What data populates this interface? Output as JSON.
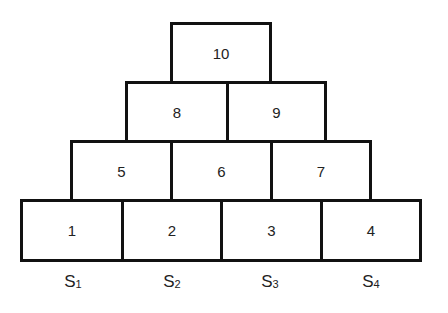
{
  "diagram": {
    "type": "pyramid of boxes",
    "rows": [
      {
        "boxes": [
          "10"
        ]
      },
      {
        "boxes": [
          "8",
          "9"
        ]
      },
      {
        "boxes": [
          "5",
          "6",
          "7"
        ]
      },
      {
        "boxes": [
          "1",
          "2",
          "3",
          "4"
        ]
      }
    ],
    "labels": [
      {
        "main": "S",
        "sub": "1"
      },
      {
        "main": "S",
        "sub": "2"
      },
      {
        "main": "S",
        "sub": "3"
      },
      {
        "main": "S",
        "sub": "4"
      }
    ]
  }
}
